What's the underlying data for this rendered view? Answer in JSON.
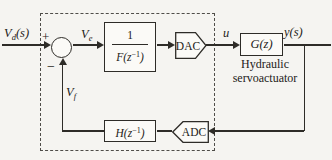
{
  "figure": {
    "kind": "control-block-diagram",
    "colors": {
      "background": "#f5f4f1",
      "line": "#2e2c28",
      "dashed_boundary": "#4f4d49"
    },
    "signals": {
      "input": {
        "base": "V",
        "sub": "d",
        "args": "(s)"
      },
      "error": {
        "base": "V",
        "sub": "e",
        "args": ""
      },
      "feedback": {
        "base": "V",
        "sub": "f",
        "args": ""
      },
      "control": {
        "label": "u"
      },
      "output": {
        "label": "y(s)"
      }
    },
    "summing_junction": {
      "plus": "+",
      "minus": "−"
    },
    "blocks": {
      "filter": {
        "numerator": "1",
        "den_main": "F(z",
        "den_sup": "−1",
        "den_end": ")"
      },
      "dac": {
        "label": "DAC"
      },
      "plant": {
        "label": "G(z)",
        "caption1": "Hydraulic",
        "caption2": "servoactuator"
      },
      "adc": {
        "label": "ADC"
      },
      "sensor": {
        "main": "H(z",
        "sup": "−1",
        "end": ")"
      }
    }
  }
}
